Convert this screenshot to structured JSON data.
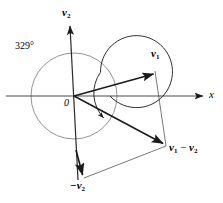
{
  "figure": {
    "kind": "vector-diagram",
    "width": 223,
    "height": 203,
    "background": "#ffffff",
    "stroke_color": "#1a1a1a",
    "thin_stroke_color": "#555555",
    "circle_color": "#6b6b6b"
  },
  "labels": {
    "angle": "329°",
    "origin": "0",
    "x_axis": "x",
    "v2_axis_name": "v",
    "v2_axis_sub": "2",
    "v1_name": "v",
    "v1_sub": "1",
    "neg_v2_text": "−v",
    "neg_v2_sub": "2",
    "difference_a": "v",
    "difference_a_sub": "1",
    "difference_op": "−",
    "difference_b": "v",
    "difference_b_sub": "2"
  },
  "geometry": {
    "origin": {
      "x": 74,
      "y": 96
    },
    "circle_radius": 43,
    "x_axis": {
      "x1": 6,
      "y1": 96,
      "x2": 205,
      "y2": 96
    },
    "v2_axis": {
      "x1": 78,
      "y1": 178,
      "x2": 70,
      "y2": 24
    },
    "v1_tip": {
      "x": 155,
      "y": 73
    },
    "diff_tip": {
      "x": 165,
      "y": 145
    },
    "neg_v2_tip": {
      "x": 83,
      "y": 177
    },
    "arc_sweep_degrees": 329
  },
  "elements": [
    {
      "name": "x-axis",
      "type": "axis"
    },
    {
      "name": "v2-axis",
      "type": "axis"
    },
    {
      "name": "unit-circle",
      "type": "circle"
    },
    {
      "name": "vector-v1",
      "type": "vector"
    },
    {
      "name": "vector-v1-minus-v2",
      "type": "vector"
    },
    {
      "name": "vector-neg-v2",
      "type": "vector"
    },
    {
      "name": "angle-arc",
      "type": "arc"
    },
    {
      "name": "construction-line-right",
      "type": "guide"
    },
    {
      "name": "construction-line-bottom",
      "type": "guide"
    }
  ]
}
